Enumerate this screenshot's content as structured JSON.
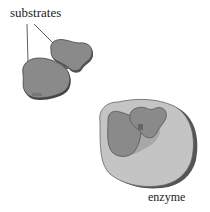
{
  "diagram": {
    "labels": {
      "substrates": "substrates",
      "enzyme": "enzyme"
    },
    "colors": {
      "substrate_fill": "#8a8a8a",
      "substrate_edge": "#444444",
      "enzyme_fill": "#c4c4c4",
      "enzyme_edge": "#555555",
      "background": "#ffffff"
    }
  }
}
